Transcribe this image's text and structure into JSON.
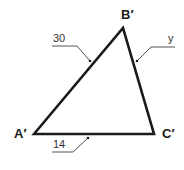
{
  "diagram": {
    "type": "triangle",
    "colors": {
      "stroke": "#1a1a1a",
      "leader": "#555555",
      "background": "#ffffff"
    },
    "vertices": [
      {
        "name": "A'",
        "x": 34,
        "y": 134
      },
      {
        "name": "B'",
        "x": 123,
        "y": 28
      },
      {
        "name": "C'",
        "x": 154,
        "y": 134
      }
    ],
    "sides": [
      {
        "from": "A'",
        "to": "B'",
        "label": "30"
      },
      {
        "from": "B'",
        "to": "C'",
        "label": "y"
      },
      {
        "from": "A'",
        "to": "C'",
        "label": "14"
      }
    ]
  },
  "labels": {
    "vertex_a": "A′",
    "vertex_b": "B′",
    "vertex_c": "C′",
    "side_ab": "30",
    "side_bc": "y",
    "side_ac": "14"
  }
}
